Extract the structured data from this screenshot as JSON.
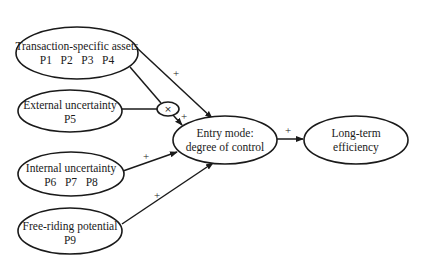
{
  "diagram": {
    "type": "path-model",
    "nodes": {
      "transaction_assets": {
        "label": "Transaction-specific assets",
        "sublabel": "P1   P2   P3   P4"
      },
      "external_uncertainty": {
        "label": "External uncertainty",
        "sublabel": "P5"
      },
      "internal_uncertainty": {
        "label": "Internal uncertainty",
        "sublabel": "P6   P7   P8"
      },
      "free_riding": {
        "label": "Free-riding potential",
        "sublabel": "P9"
      },
      "entry_mode": {
        "label": "Entry mode:",
        "sublabel": "degree of control"
      },
      "long_term": {
        "label": "Long-term",
        "sublabel": "efficiency"
      },
      "interaction": {
        "label": "×"
      }
    },
    "edges": [
      {
        "from": "transaction_assets",
        "to": "entry_mode",
        "sign": "+"
      },
      {
        "from": "transaction_assets",
        "to": "interaction",
        "sign": ""
      },
      {
        "from": "external_uncertainty",
        "to": "interaction",
        "sign": ""
      },
      {
        "from": "interaction",
        "to": "entry_mode",
        "sign": "+"
      },
      {
        "from": "internal_uncertainty",
        "to": "entry_mode",
        "sign": "+"
      },
      {
        "from": "free_riding",
        "to": "entry_mode",
        "sign": "+"
      },
      {
        "from": "entry_mode",
        "to": "long_term",
        "sign": "+"
      }
    ],
    "colors": {
      "stroke": "#1a1a1a",
      "background": "#ffffff"
    }
  }
}
